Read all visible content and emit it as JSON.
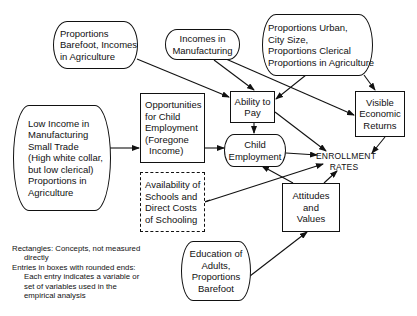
{
  "diagram": {
    "nodes": {
      "barefoot_agri": {
        "shape": "rounded",
        "lines": [
          "Proportions",
          "Barefoot, Incomes",
          "in Agriculture"
        ]
      },
      "incomes_manuf": {
        "shape": "rounded",
        "lines": [
          "Incomes in",
          "Manufacturing"
        ]
      },
      "urban": {
        "shape": "rounded",
        "lines": [
          "Proportions Urban,",
          "City Size,",
          "Proportions Clerical",
          "Proportions in Agriculture"
        ]
      },
      "low_income": {
        "shape": "rounded",
        "lines": [
          "Low Income in",
          "Manufacturing",
          "Small Trade",
          "(High white collar,",
          "but low clerical)",
          "Proportions in",
          "Agriculture"
        ]
      },
      "opportunities": {
        "shape": "rectangle",
        "lines": [
          "Opportunities",
          "for Child",
          "Employment",
          "(Foregone",
          "Income)"
        ]
      },
      "ability": {
        "shape": "rectangle",
        "lines": [
          "Ability to",
          "Pay"
        ]
      },
      "visible": {
        "shape": "rectangle",
        "lines": [
          "Visible",
          "Economic",
          "Returns"
        ]
      },
      "child_emp": {
        "shape": "rounded",
        "lines": [
          "Child",
          "Employment"
        ]
      },
      "enrollment": {
        "shape": "label",
        "lines": [
          "ENROLLMENT",
          "RATES"
        ]
      },
      "availability": {
        "shape": "dashed",
        "lines": [
          "Availability of",
          "Schools and",
          "Direct Costs",
          "of Schooling"
        ]
      },
      "attitudes": {
        "shape": "rectangle",
        "lines": [
          "Attitudes",
          "and",
          "Values"
        ]
      },
      "education": {
        "shape": "rounded",
        "lines": [
          "Education of",
          "Adults,",
          "Proportions",
          "Barefoot"
        ]
      }
    },
    "edges": [
      {
        "from": "barefoot_agri",
        "to": "ability"
      },
      {
        "from": "incomes_manuf",
        "to": "ability"
      },
      {
        "from": "incomes_manuf",
        "to": "visible"
      },
      {
        "from": "urban",
        "to": "ability"
      },
      {
        "from": "urban",
        "to": "visible"
      },
      {
        "from": "low_income",
        "to": "opportunities"
      },
      {
        "from": "opportunities",
        "to": "child_emp"
      },
      {
        "from": "ability",
        "to": "child_emp"
      },
      {
        "from": "ability",
        "to": "enrollment"
      },
      {
        "from": "child_emp",
        "to": "enrollment"
      },
      {
        "from": "visible",
        "to": "enrollment"
      },
      {
        "from": "availability",
        "to": "enrollment"
      },
      {
        "from": "attitudes",
        "to": "child_emp"
      },
      {
        "from": "attitudes",
        "to": "enrollment"
      },
      {
        "from": "education",
        "to": "attitudes"
      }
    ],
    "legend": {
      "rect_line1": "Rectangles:  Concepts, not measured",
      "rect_line2": "directly",
      "round_line1": "Entries in boxes with rounded ends:",
      "round_line2": "Each entry indicates a variable or",
      "round_line3": "set of variables used in the",
      "round_line4": "empirical analysis"
    }
  }
}
